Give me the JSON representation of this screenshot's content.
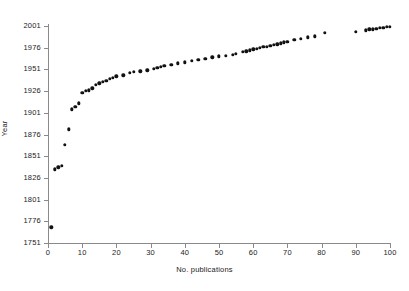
{
  "chart_data": {
    "type": "scatter",
    "title": "",
    "xlabel": "No. publications",
    "ylabel": "Year",
    "xlim": [
      0,
      100
    ],
    "ylim": [
      1751,
      2001
    ],
    "xticks": [
      0,
      10,
      20,
      30,
      40,
      50,
      60,
      70,
      80,
      90,
      100
    ],
    "yticks": [
      1751,
      1776,
      1801,
      1826,
      1851,
      1876,
      1901,
      1926,
      1951,
      1976,
      2001
    ],
    "grid": false,
    "legend": null,
    "marker": "filled-diamond",
    "marker_color": "#111111",
    "x": [
      1,
      2,
      3,
      4,
      5,
      6,
      7,
      8,
      9,
      10,
      11,
      12,
      13,
      14,
      15,
      16,
      17,
      18,
      19,
      20,
      22,
      24,
      25,
      27,
      29,
      31,
      32,
      33,
      34,
      36,
      38,
      40,
      42,
      44,
      46,
      48,
      50,
      52,
      54,
      55,
      57,
      58,
      59,
      60,
      61,
      62,
      63,
      64,
      65,
      66,
      67,
      68,
      69,
      70,
      72,
      74,
      76,
      78,
      81,
      90,
      93,
      94,
      95,
      96,
      97,
      98,
      99,
      100
    ],
    "y": [
      1769,
      1836,
      1838,
      1840,
      1864,
      1882,
      1905,
      1908,
      1912,
      1924,
      1926,
      1927,
      1929,
      1933,
      1935,
      1937,
      1938,
      1940,
      1941,
      1943,
      1944,
      1947,
      1948,
      1949,
      1950,
      1952,
      1953,
      1954,
      1955,
      1956,
      1958,
      1959,
      1961,
      1962,
      1963,
      1965,
      1966,
      1967,
      1968,
      1969,
      1971,
      1972,
      1973,
      1974,
      1975,
      1976,
      1977,
      1977,
      1978,
      1979,
      1980,
      1981,
      1982,
      1983,
      1985,
      1986,
      1988,
      1989,
      1993,
      1994,
      1996,
      1997,
      1997,
      1998,
      1999,
      1999,
      2000,
      2000
    ],
    "series": [
      {
        "name": "publications-by-year",
        "points": [
          [
            1,
            1769
          ],
          [
            2,
            1836
          ],
          [
            3,
            1838
          ],
          [
            4,
            1840
          ],
          [
            5,
            1864
          ],
          [
            6,
            1882
          ],
          [
            7,
            1905
          ],
          [
            8,
            1908
          ],
          [
            9,
            1912
          ],
          [
            10,
            1924
          ],
          [
            11,
            1926
          ],
          [
            12,
            1927
          ],
          [
            13,
            1929
          ],
          [
            14,
            1933
          ],
          [
            15,
            1935
          ],
          [
            16,
            1937
          ],
          [
            17,
            1938
          ],
          [
            18,
            1940
          ],
          [
            19,
            1941
          ],
          [
            20,
            1943
          ],
          [
            22,
            1944
          ],
          [
            24,
            1947
          ],
          [
            25,
            1948
          ],
          [
            27,
            1949
          ],
          [
            29,
            1950
          ],
          [
            31,
            1952
          ],
          [
            32,
            1953
          ],
          [
            33,
            1954
          ],
          [
            34,
            1955
          ],
          [
            36,
            1956
          ],
          [
            38,
            1958
          ],
          [
            40,
            1959
          ],
          [
            42,
            1961
          ],
          [
            44,
            1962
          ],
          [
            46,
            1963
          ],
          [
            48,
            1965
          ],
          [
            50,
            1966
          ],
          [
            52,
            1967
          ],
          [
            54,
            1968
          ],
          [
            55,
            1969
          ],
          [
            57,
            1971
          ],
          [
            58,
            1972
          ],
          [
            59,
            1973
          ],
          [
            60,
            1974
          ],
          [
            61,
            1975
          ],
          [
            62,
            1976
          ],
          [
            63,
            1977
          ],
          [
            64,
            1977
          ],
          [
            65,
            1978
          ],
          [
            66,
            1979
          ],
          [
            67,
            1980
          ],
          [
            68,
            1981
          ],
          [
            69,
            1982
          ],
          [
            70,
            1983
          ],
          [
            72,
            1985
          ],
          [
            74,
            1986
          ],
          [
            76,
            1988
          ],
          [
            78,
            1989
          ],
          [
            81,
            1993
          ],
          [
            90,
            1994
          ],
          [
            93,
            1996
          ],
          [
            94,
            1997
          ],
          [
            95,
            1997
          ],
          [
            96,
            1998
          ],
          [
            97,
            1999
          ],
          [
            98,
            1999
          ],
          [
            99,
            2000
          ],
          [
            100,
            2000
          ]
        ]
      }
    ]
  },
  "axes": {
    "y_title": "Year",
    "x_title": "No. publications",
    "y_tick_labels": [
      "2001",
      "1976",
      "1951",
      "1926",
      "1901",
      "1876",
      "1851",
      "1826",
      "1801",
      "1776",
      "1751"
    ],
    "x_tick_labels": [
      "0",
      "10",
      "20",
      "30",
      "40",
      "50",
      "60",
      "70",
      "80",
      "90",
      "100"
    ]
  },
  "colors": {
    "axis": "#8a8a8a",
    "marker": "#111111",
    "background": "#ffffff",
    "text": "#222222"
  }
}
